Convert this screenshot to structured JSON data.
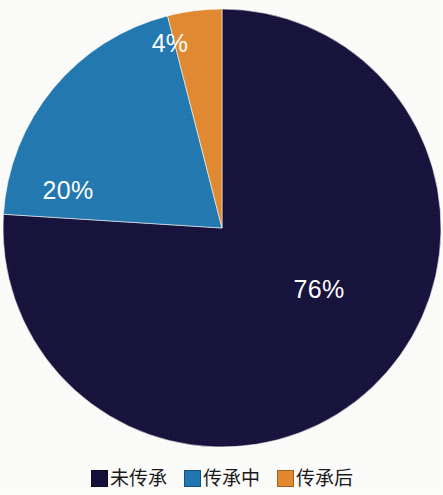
{
  "chart_data": {
    "type": "pie",
    "title": "",
    "subtitle": "",
    "xlabel": "",
    "ylabel": "",
    "categories": [
      "未传承",
      "传承中",
      "传承后"
    ],
    "values": [
      76,
      20,
      4
    ],
    "value_unit": "%",
    "data_labels": [
      "76%",
      "20%",
      "4%"
    ],
    "colors": [
      "#14103a",
      "#2077b0",
      "#e2892f"
    ],
    "start_angle_deg": 0,
    "direction": "clockwise",
    "legend_position": "bottom",
    "grid": false,
    "series": [
      {
        "name": "传承状况占比",
        "slices": [
          {
            "label": "未传承",
            "value": 76,
            "display": "76%",
            "color": "#14103a",
            "label_color": "#ffffff"
          },
          {
            "label": "传承中",
            "value": 20,
            "display": "20%",
            "color": "#2077b0",
            "label_color": "#ffffff"
          },
          {
            "label": "传承后",
            "value": 4,
            "display": "4%",
            "color": "#e2892f",
            "label_color": "#ffffff"
          }
        ]
      }
    ]
  },
  "legend": {
    "items": [
      {
        "label": "未传承",
        "color": "#14103a"
      },
      {
        "label": "传承中",
        "color": "#2077b0"
      },
      {
        "label": "传承后",
        "color": "#e2892f"
      }
    ]
  },
  "slice_labels": {
    "navy": "76%",
    "blue": "20%",
    "orange": "4%"
  },
  "colors": {
    "navy": "#14103a",
    "blue": "#2077b0",
    "orange": "#e2892f",
    "background": "#fdfdfb",
    "label_text": "#ffffff",
    "legend_text": "#1a1a1a"
  }
}
